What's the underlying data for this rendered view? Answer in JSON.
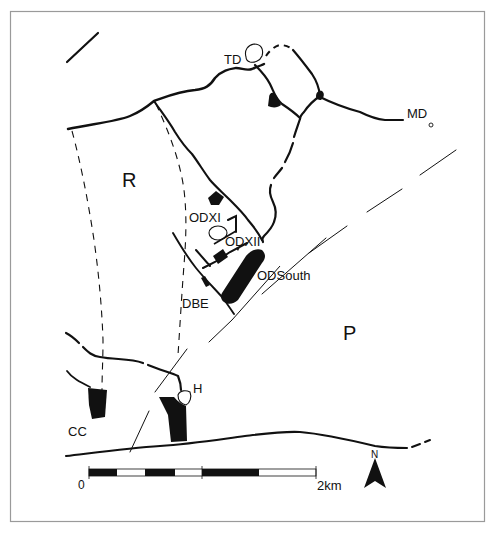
{
  "map": {
    "regions": {
      "R": "R",
      "P": "P"
    },
    "sites": {
      "TD": "TD",
      "MD": "MD",
      "ODXI": "ODXI",
      "ODXII": "ODXII",
      "ODSouth": "ODSouth",
      "DBE": "DBE",
      "H": "H",
      "CC": "CC"
    },
    "scale_bar": {
      "start_label": "0",
      "end_label": "2km"
    },
    "north_arrow": {
      "label": "N"
    },
    "colors": {
      "ink": "#111111",
      "frame": "#9a9a9a",
      "background": "#ffffff"
    }
  }
}
